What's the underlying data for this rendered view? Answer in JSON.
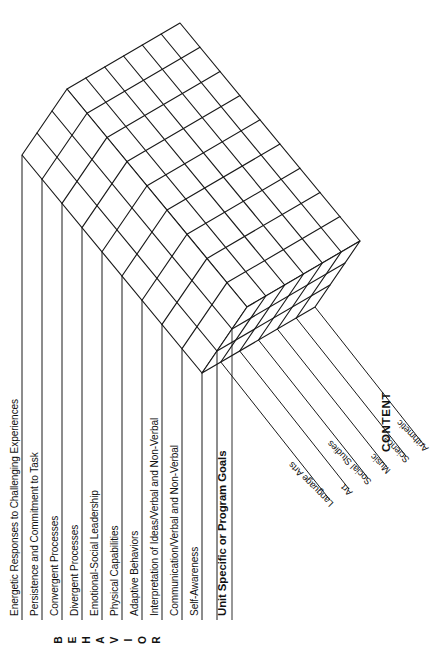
{
  "diagram": {
    "type": "3d-matrix-cube",
    "orientation": "rotated-90-clockwise",
    "stroke_color": "#1a1a1a",
    "background_color": "#ffffff"
  },
  "axes": {
    "behavior": {
      "title": "BEHAVIOR",
      "letters": [
        "B",
        "E",
        "H",
        "A",
        "V",
        "I",
        "O",
        "R"
      ],
      "count": 9,
      "items": [
        "Energetic Responses to Challenging Experiences",
        "Persistence and Commitment to Task",
        "Convergent Processes",
        "Divergent Processes",
        "Emotional-Social Leadership",
        "Physical Capabilities",
        "Adaptive Behaviors",
        "Interpretation of Ideas/Verbal and Non-Verbal",
        "Communication/Verbal and Non-Verbal",
        "Self-Awareness"
      ]
    },
    "content": {
      "title": "CONTENT",
      "count": 6,
      "items": [
        "Language Arts",
        "Art",
        "Social Studies",
        "Music",
        "Science",
        "Arithmetic"
      ]
    },
    "depth": {
      "title": "Unit Specific or Program Goals",
      "count": 3
    }
  }
}
